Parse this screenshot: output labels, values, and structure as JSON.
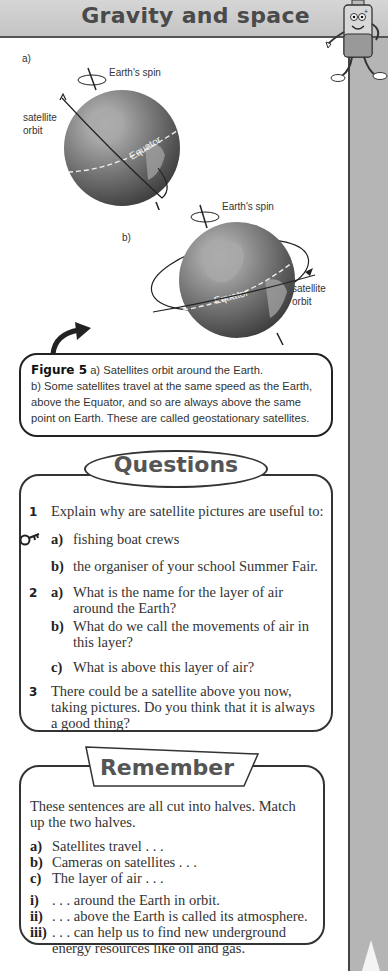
{
  "header": {
    "title": "Gravity and space"
  },
  "figure": {
    "part_a": {
      "label": "a)",
      "spin_label": "Earth's spin",
      "orbit_label_line1": "satellite",
      "orbit_label_line2": "orbit",
      "equator_label": "Equator"
    },
    "part_b": {
      "label": "b)",
      "spin_label": "Earth's spin",
      "orbit_label_line1": "satellite",
      "orbit_label_line2": "orbit",
      "equator_label": "Equator"
    },
    "caption": {
      "figure_number": "Figure 5",
      "line1": " a) Satellites orbit around the Earth.",
      "line2": "b) Some satellites travel at the same speed as the Earth,",
      "line3": "above the Equator, and so are always above the same",
      "line4": "point on Earth. These are called geostationary satellites."
    }
  },
  "questions": {
    "title": "Questions",
    "items": [
      {
        "num": "1",
        "text": "Explain why are satellite pictures are useful to:"
      },
      {
        "letter": "a)",
        "text": "fishing boat crews"
      },
      {
        "letter": "b)",
        "text": "the organiser of your school Summer Fair."
      },
      {
        "num": "2",
        "letter": "a)",
        "text1": "What is the name for the layer of air",
        "text2": "around the Earth?"
      },
      {
        "letter": "b)",
        "text1": "What do we call the movements of air in",
        "text2": "this layer?"
      },
      {
        "letter": "c)",
        "text": "What is above this layer of air?"
      },
      {
        "num": "3",
        "text1": "There could be a satellite above you now,",
        "text2": "taking pictures. Do you think that it is always",
        "text3": "a good thing?"
      }
    ]
  },
  "remember": {
    "title": "Remember",
    "intro1": "These sentences are all cut into halves. Match",
    "intro2": "up the two halves.",
    "starts": [
      {
        "letter": "a)",
        "text": "Satellites travel . . ."
      },
      {
        "letter": "b)",
        "text": "Cameras on satellites . . ."
      },
      {
        "letter": "c)",
        "text": "The layer of air . . ."
      }
    ],
    "ends": [
      {
        "letter": "i)",
        "text": ". . .   around the Earth in orbit."
      },
      {
        "letter": "ii)",
        "text": ". . .   above the Earth is called its atmosphere."
      },
      {
        "letter": "iii)",
        "text1": ". . .   can help us to find new underground",
        "text2": "energy resources like oil and gas."
      }
    ]
  },
  "colors": {
    "header_bg": "#cccccc",
    "side_strip": "#b5b5b5",
    "title_text": "#4a4a4a",
    "border": "#333333"
  }
}
